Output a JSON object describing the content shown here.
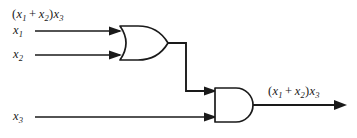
{
  "figure": {
    "background_color": "#ffffff",
    "line_color": "#1a1a1a"
  },
  "caption": {
    "open_paren": "(",
    "var1": "x",
    "var1_sub": "1",
    "operator": "+",
    "var2": "x",
    "var2_sub": "2",
    "close_paren": ")",
    "var3": "x",
    "var3_sub": "3"
  },
  "inputs": [
    {
      "name": "x1",
      "var": "x",
      "sub": "1",
      "target": "or-gate"
    },
    {
      "name": "x2",
      "var": "x",
      "sub": "2",
      "target": "or-gate"
    },
    {
      "name": "x3",
      "var": "x",
      "sub": "3",
      "target": "and-gate"
    }
  ],
  "gates": [
    {
      "name": "or-gate",
      "type": "OR",
      "inputs": 2
    },
    {
      "name": "and-gate",
      "type": "AND",
      "inputs": 2
    }
  ],
  "output": {
    "open_paren": "(",
    "var1": "x",
    "var1_sub": "1",
    "operator": "+",
    "var2": "x",
    "var2_sub": "2",
    "close_paren": ")",
    "var3": "x",
    "var3_sub": "3"
  }
}
